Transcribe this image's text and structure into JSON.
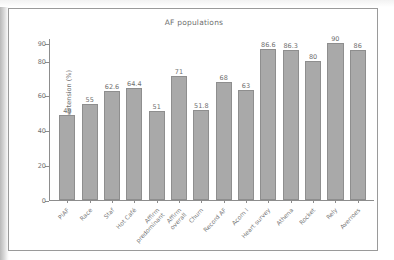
{
  "figure": {
    "title": "AF populations",
    "frame_color": "#9a9a9a",
    "background": "#ffffff"
  },
  "chart_data": {
    "type": "bar",
    "title": "AF populations",
    "xlabel": "",
    "ylabel": "Patients with hypertension (%)",
    "ylim": [
      0,
      93
    ],
    "yticks": [
      0,
      20,
      40,
      60,
      80,
      90
    ],
    "grid": false,
    "legend": null,
    "bar_color": "#a9a9a9",
    "bar_edge_color": "#8e8e8e",
    "categories": [
      "PIAF",
      "Race",
      "Staf",
      "Hot Café",
      "Affirm predominant",
      "Affirm overall",
      "Churn",
      "Record AF",
      "Acorn I",
      "Heart survey",
      "Athena",
      "Rocket",
      "Rely",
      "Averroes"
    ],
    "values": [
      49,
      55,
      62.6,
      64.4,
      51,
      71,
      51.8,
      68,
      63,
      86.6,
      86.3,
      80,
      90,
      86
    ],
    "value_labels": [
      "49",
      "55",
      "62.6",
      "64.4",
      "51",
      "71",
      "51.8",
      "68",
      "63",
      "86.6",
      "86.3",
      "80",
      "90",
      "86"
    ]
  }
}
